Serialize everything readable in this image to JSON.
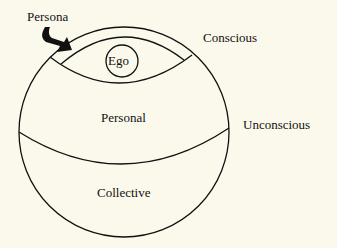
{
  "diagram": {
    "labels": {
      "persona": "Persona",
      "ego": "Ego",
      "conscious": "Conscious",
      "personal": "Personal",
      "unconscious": "Unconscious",
      "collective": "Collective"
    },
    "colors": {
      "background": "#fbf9ec",
      "stroke": "#111111"
    }
  }
}
